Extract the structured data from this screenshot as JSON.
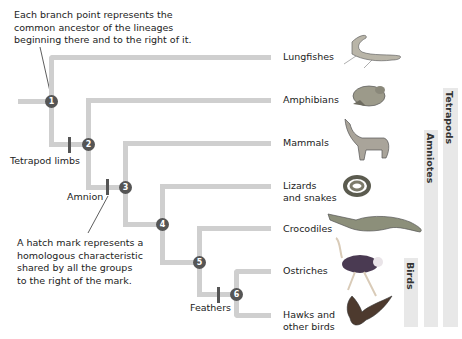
{
  "annotations": {
    "branch_point_note": [
      "Each branch point represents the",
      "common ancestor of the lineages",
      "beginning there and to the right of it."
    ],
    "hatch_mark_note": [
      "A hatch mark represents a",
      "homologous characteristic",
      "shared by all the groups",
      "to the right of the mark."
    ]
  },
  "taxa": [
    {
      "label": [
        "Lungfishes"
      ],
      "image": "lungfish-illustration"
    },
    {
      "label": [
        "Amphibians"
      ],
      "image": "frog-illustration"
    },
    {
      "label": [
        "Mammals"
      ],
      "image": "wolf-illustration"
    },
    {
      "label": [
        "Lizards",
        "and snakes"
      ],
      "image": "snake-illustration"
    },
    {
      "label": [
        "Crocodiles"
      ],
      "image": "crocodile-illustration"
    },
    {
      "label": [
        "Ostriches"
      ],
      "image": "ostrich-illustration"
    },
    {
      "label": [
        "Hawks and",
        "other birds"
      ],
      "image": "hawk-illustration"
    }
  ],
  "nodes": [
    "1",
    "2",
    "3",
    "4",
    "5",
    "6"
  ],
  "traits": {
    "tetrapod_limbs": "Tetrapod limbs",
    "amnion": "Amnion",
    "feathers": "Feathers"
  },
  "clades": {
    "tetrapods": "Tetrapods",
    "amniotes": "Amniotes",
    "birds": "Birds"
  },
  "colors": {
    "branch": "#cfcfcf",
    "node": "#555555",
    "clade_bar": "#e8e8e8"
  }
}
